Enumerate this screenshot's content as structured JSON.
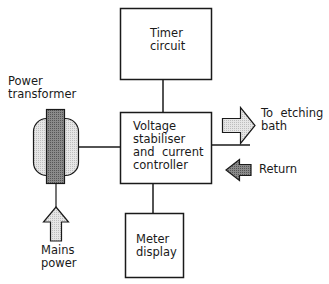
{
  "diagram": {
    "type": "block-diagram",
    "blocks": {
      "timer": {
        "line1": "Timer",
        "line2": "circuit"
      },
      "controller": {
        "line1": "Voltage",
        "line2": "stabiliser",
        "line3": "and  current",
        "line4": "controller"
      },
      "meter": {
        "line1": "Meter",
        "line2": "display"
      }
    },
    "labels": {
      "transformer": {
        "line1": "Power",
        "line2": "transformer"
      },
      "mains": {
        "line1": "Mains",
        "line2": "power"
      },
      "etching": {
        "line1": "To  etching",
        "line2": "bath"
      },
      "return": "Return"
    },
    "colors": {
      "line": "#1a1a1a",
      "light_fill": "#d9d9d9",
      "dark_fill": "#7a7a7a",
      "transformer_core": "#6e6e6e",
      "transformer_body": "#dcdcdc"
    },
    "connections": [
      {
        "from": "Timer circuit",
        "to": "Voltage stabiliser and current controller"
      },
      {
        "from": "Power transformer",
        "to": "Voltage stabiliser and current controller"
      },
      {
        "from": "Voltage stabiliser and current controller",
        "to": "Meter display"
      },
      {
        "from": "Voltage stabiliser and current controller",
        "to": "To etching bath"
      },
      {
        "from": "Return",
        "to": "Voltage stabiliser and current controller"
      },
      {
        "from": "Mains power",
        "to": "Power transformer"
      }
    ]
  }
}
